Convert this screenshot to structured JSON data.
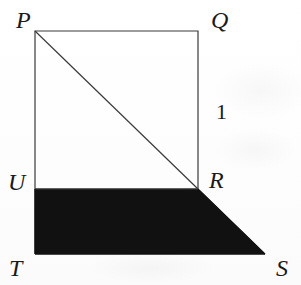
{
  "figure": {
    "canvas": {
      "width": 301,
      "height": 285
    },
    "background_color": "#fefefe",
    "stroke_color": "#3a3a3a",
    "shaded_fill_color": "#111111",
    "stroke_width": 1.2,
    "vertices": {
      "P": {
        "x": 35,
        "y": 31
      },
      "Q": {
        "x": 198,
        "y": 31
      },
      "R": {
        "x": 198,
        "y": 189
      },
      "U": {
        "x": 35,
        "y": 189
      },
      "T": {
        "x": 35,
        "y": 254
      },
      "S": {
        "x": 265,
        "y": 254
      }
    },
    "shapes": {
      "square_points": "35,31 198,31 198,189 35,189",
      "diagonal": {
        "x1": 35,
        "y1": 31,
        "x2": 198,
        "y2": 189
      },
      "shaded_trapezoid_points": "35,189 198,189 265,254 35,254"
    },
    "labels": [
      {
        "id": "label-P",
        "text": "P",
        "x": 16,
        "y": 8,
        "size": 24,
        "italic": true
      },
      {
        "id": "label-Q",
        "text": "Q",
        "x": 211,
        "y": 8,
        "size": 24,
        "italic": true
      },
      {
        "id": "label-1",
        "text": "1",
        "x": 216,
        "y": 101,
        "size": 22,
        "italic": false
      },
      {
        "id": "label-U",
        "text": "U",
        "x": 8,
        "y": 170,
        "size": 24,
        "italic": true
      },
      {
        "id": "label-R",
        "text": "R",
        "x": 209,
        "y": 168,
        "size": 24,
        "italic": true
      },
      {
        "id": "label-T",
        "text": "T",
        "x": 9,
        "y": 256,
        "size": 24,
        "italic": true
      },
      {
        "id": "label-S",
        "text": "S",
        "x": 276,
        "y": 256,
        "size": 24,
        "italic": true
      }
    ],
    "measure_label": "1",
    "measure_of_side": "QR"
  }
}
